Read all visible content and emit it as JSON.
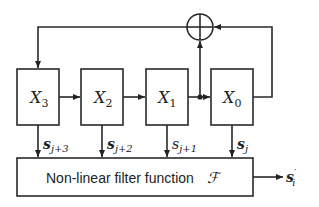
{
  "diagram": {
    "registers": [
      {
        "name": "X",
        "sub": "3",
        "output_label": "s",
        "output_sub": "j+3"
      },
      {
        "name": "X",
        "sub": "2",
        "output_label": "s",
        "output_sub": "j+2"
      },
      {
        "name": "X",
        "sub": "1",
        "output_label": "s",
        "output_sub": "j+1"
      },
      {
        "name": "X",
        "sub": "0",
        "output_label": "s",
        "output_sub": "j"
      }
    ],
    "filter": {
      "label": "Non-linear filter function",
      "symbol": "ℱ"
    },
    "output": {
      "label": "s",
      "prime": "′",
      "sub": "i"
    },
    "xor_node": "xor-adder"
  }
}
